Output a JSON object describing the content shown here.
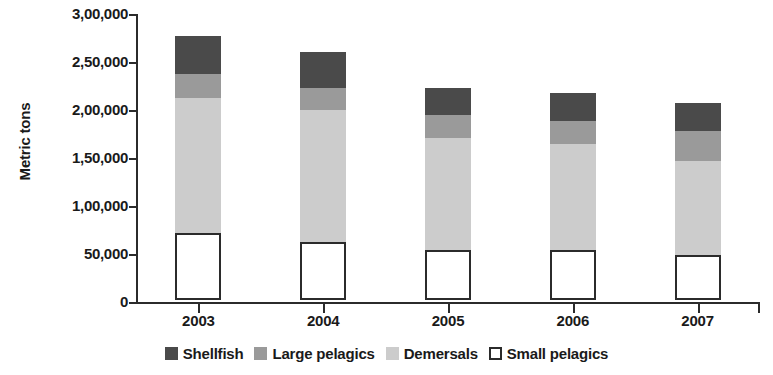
{
  "chart_data": {
    "type": "bar",
    "subtype": "stacked-vertical",
    "title": "",
    "xlabel": "",
    "ylabel": "Metric tons",
    "categories": [
      "2003",
      "2004",
      "2005",
      "2006",
      "2007"
    ],
    "ylim": [
      0,
      300000
    ],
    "ytick_values": [
      300000,
      250000,
      200000,
      150000,
      100000,
      50000,
      0
    ],
    "ytick_labels": [
      "3,00,000",
      "2,50,000",
      "2,00,000",
      "1,50,000",
      "1,00,000",
      "50,000",
      "0"
    ],
    "grid": false,
    "legend_position": "bottom",
    "stack_order_bottom_to_top": [
      "Small pelagics",
      "Demersals",
      "Large pelagics",
      "Shellfish"
    ],
    "series": [
      {
        "name": "Shellfish",
        "color": "#4a4a4a",
        "values": [
          40000,
          37000,
          28000,
          29000,
          29000
        ]
      },
      {
        "name": "Large pelagics",
        "color": "#9a9a9a",
        "values": [
          25000,
          23000,
          24000,
          24000,
          31000
        ]
      },
      {
        "name": "Demersals",
        "color": "#cccccc",
        "values": [
          140000,
          138000,
          117000,
          111000,
          98000
        ]
      },
      {
        "name": "Small pelagics",
        "color": "#ffffff",
        "outline": "#2b2b2b",
        "values": [
          70000,
          60000,
          52000,
          52000,
          47000
        ]
      }
    ],
    "totals": [
      275000,
      258000,
      221000,
      216000,
      205000
    ]
  },
  "axis": {
    "y_title": "Metric tons",
    "y_ticks": [
      {
        "label": "3,00,000",
        "value": 300000
      },
      {
        "label": "2,50,000",
        "value": 250000
      },
      {
        "label": "2,00,000",
        "value": 200000
      },
      {
        "label": "1,50,000",
        "value": 150000
      },
      {
        "label": "1,00,000",
        "value": 100000
      },
      {
        "label": "50,000",
        "value": 50000
      },
      {
        "label": "0",
        "value": 0
      }
    ],
    "x_categories": [
      "2003",
      "2004",
      "2005",
      "2006",
      "2007"
    ]
  },
  "legend": {
    "items": [
      {
        "label": "Shellfish",
        "color": "#4a4a4a",
        "outlined": false
      },
      {
        "label": "Large pelagics",
        "color": "#9a9a9a",
        "outlined": false
      },
      {
        "label": "Demersals",
        "color": "#cccccc",
        "outlined": false
      },
      {
        "label": "Small pelagics",
        "color": "#ffffff",
        "outlined": true
      }
    ]
  }
}
